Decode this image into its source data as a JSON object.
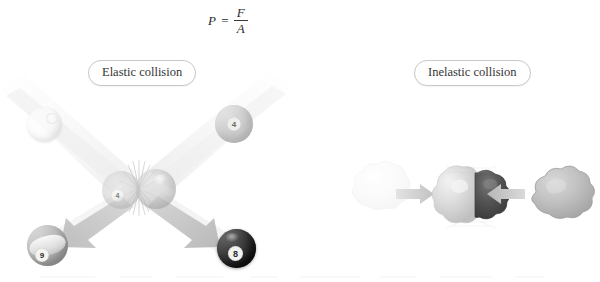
{
  "figure": {
    "title": "",
    "background_color": "#ffffff",
    "width": 600,
    "height": 282
  },
  "formula": {
    "name": "pressure-formula",
    "lhs": "P",
    "equals": "=",
    "numerator": "F",
    "denominator": "A",
    "plain_text": "P = F / A",
    "color": "#2b2b2b"
  },
  "panels": [
    {
      "id": "elastic",
      "label": "Elastic collision",
      "label_border_color": "#c9c9c9",
      "label_text_color": "#343434"
    },
    {
      "id": "inelastic",
      "label": "Inelastic collision",
      "label_border_color": "#c9c9c9",
      "label_text_color": "#343434"
    }
  ],
  "elastic": {
    "caption": "Elastic collision",
    "balls": [
      {
        "name": "cue-ball-incoming",
        "role": "incoming-upper-left",
        "appearance": "white cue ball",
        "number": "",
        "color": "#f7f7f7",
        "opacity": "faint"
      },
      {
        "name": "gray-ball-incoming",
        "role": "incoming-upper-right",
        "appearance": "gray numbered ball",
        "number": "4",
        "color": "#b4b4b4",
        "opacity": "faint"
      },
      {
        "name": "ball-contact-left",
        "role": "contact-moment-left",
        "appearance": "ghosted ball at impact",
        "number": "4",
        "color": "#cfcfcf",
        "opacity": "ghost"
      },
      {
        "name": "ball-contact-right",
        "role": "contact-moment-right",
        "appearance": "ghosted ball at impact",
        "number": "",
        "color": "#c6c6c6",
        "opacity": "ghost"
      },
      {
        "name": "striped-ball-outgoing",
        "role": "outgoing-lower-left",
        "appearance": "gray striped ball",
        "number": "9",
        "color": "#a8a8a8",
        "opacity": "solid"
      },
      {
        "name": "eight-ball-outgoing",
        "role": "outgoing-lower-right",
        "appearance": "black eight ball",
        "number": "8",
        "color": "#1c1c1c",
        "opacity": "solid"
      }
    ],
    "impact_marker": "radiating starburst lines at contact point",
    "motion_trails": 2,
    "outgoing_arrows": 2,
    "arrow_color": "#c3c3c3"
  },
  "inelastic": {
    "caption": "Inelastic collision",
    "lumps": [
      {
        "name": "clay-lump-left",
        "role": "incoming-left",
        "appearance": "pale irregular clay lump",
        "color": "#f0f0f0",
        "opacity": "very faint"
      },
      {
        "name": "clay-lump-right",
        "role": "incoming-right",
        "appearance": "gray irregular clay lump",
        "color": "#b9b9b9",
        "opacity": "solid"
      },
      {
        "name": "merged-mass-light-half",
        "role": "result-left-half",
        "appearance": "light gray merged lump half",
        "color": "#dcdcdc",
        "opacity": "solid"
      },
      {
        "name": "merged-mass-dark-half",
        "role": "result-right-half",
        "appearance": "dark gray merged lump half",
        "color": "#555555",
        "opacity": "solid"
      }
    ],
    "arrows": [
      {
        "name": "arrow-left-to-center",
        "direction": "right",
        "color": "#cfcfcf"
      },
      {
        "name": "arrow-right-to-center",
        "direction": "left",
        "color": "#bdbdbd"
      }
    ],
    "impact_marker": "faint crosshatch burst behind merged mass"
  }
}
